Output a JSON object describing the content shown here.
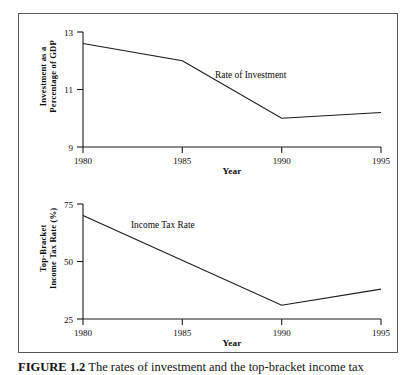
{
  "figure": {
    "caption_label": "FIGURE 1.2",
    "caption_text": "The rates of investment and the top-bracket income tax"
  },
  "chart_data": [
    {
      "type": "line",
      "panel": "top",
      "title": "",
      "xlabel": "Year",
      "ylabel": "Investment as a Percentage of GDP",
      "ylabel_line1": "Investment as a",
      "ylabel_line2": "Percentage of GDP",
      "series_label": "Rate of Investment",
      "x": [
        1980,
        1985,
        1990,
        1995
      ],
      "values": [
        12.6,
        12.0,
        10.0,
        10.2
      ],
      "xticks": [
        1980,
        1985,
        1990,
        1995
      ],
      "xticklabels": [
        "1980",
        "1985",
        "1990",
        "1995"
      ],
      "yticks": [
        9,
        11,
        13
      ],
      "yticklabels": [
        "9",
        "11",
        "13"
      ],
      "xlim": [
        1980,
        1995
      ],
      "ylim": [
        9,
        13
      ],
      "grid": false,
      "legend": "inline-annotation"
    },
    {
      "type": "line",
      "panel": "bottom",
      "title": "",
      "xlabel": "Year",
      "ylabel": "Top-Bracket Income Tax Rate (%)",
      "ylabel_line1": "Top-Bracket",
      "ylabel_line2": "Income Tax Rate (%)",
      "series_label": "Income Tax Rate",
      "x": [
        1980,
        1990,
        1995
      ],
      "values": [
        70,
        31,
        38
      ],
      "xticks": [
        1980,
        1985,
        1990,
        1995
      ],
      "xticklabels": [
        "1980",
        "1985",
        "1990",
        "1995"
      ],
      "yticks": [
        25,
        50,
        75
      ],
      "yticklabels": [
        "25",
        "50",
        "75"
      ],
      "xlim": [
        1980,
        1995
      ],
      "ylim": [
        25,
        75
      ],
      "grid": false,
      "legend": "inline-annotation"
    }
  ],
  "colors": {
    "line": "#1a1a1a",
    "axis": "#1a1a1a",
    "frame": "#5a5a5a",
    "text": "#0b0b0b",
    "background": "#ffffff"
  }
}
